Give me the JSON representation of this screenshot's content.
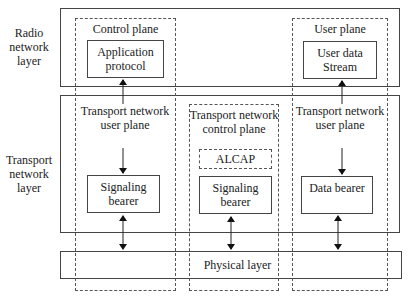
{
  "layers": {
    "radio": "Radio network layer",
    "transport": "Transport network layer"
  },
  "planes": {
    "control": {
      "title": "Control plane",
      "app_box": "Application protocol",
      "transport_label": "Transport network user plane",
      "bearer": "Signaling bearer"
    },
    "transport_control": {
      "title": "Transport network control plane",
      "alcap": "ALCAP",
      "bearer": "Signaling bearer"
    },
    "user": {
      "title": "User plane",
      "app_box": "User data Stream",
      "transport_label": "Transport network user plane",
      "bearer": "Data bearer"
    }
  },
  "physical_layer": "Physical layer"
}
